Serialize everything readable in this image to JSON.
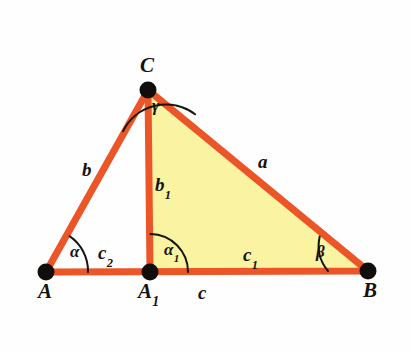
{
  "figure": {
    "type": "geometry-diagram",
    "background_color": "#fefefe",
    "stroke_color": "#eb5528",
    "fill_color": "#faf3a1",
    "arc_color": "#1a1410",
    "point_color": "#100d0b",
    "label_color": "#15110e"
  },
  "vertices": [
    {
      "id": "A",
      "label": "A",
      "sub": "",
      "x": 46,
      "y": 272,
      "label_x": 38,
      "label_y": 281
    },
    {
      "id": "B",
      "label": "B",
      "sub": "",
      "x": 368,
      "y": 271,
      "label_x": 363,
      "label_y": 280
    },
    {
      "id": "C",
      "label": "C",
      "sub": "",
      "x": 148,
      "y": 90,
      "label_x": 140,
      "label_y": 55
    },
    {
      "id": "A1",
      "label": "A",
      "sub": "1",
      "x": 150,
      "y": 272,
      "label_x": 138,
      "label_y": 281
    }
  ],
  "sides": [
    {
      "id": "b",
      "label": "b",
      "sub": "",
      "label_x": 82,
      "label_y": 160,
      "from": "A",
      "to": "C"
    },
    {
      "id": "a",
      "label": "a",
      "sub": "",
      "label_x": 258,
      "label_y": 152,
      "from": "C",
      "to": "B"
    },
    {
      "id": "c",
      "label": "c",
      "sub": "",
      "label_x": 198,
      "label_y": 283,
      "from": "A",
      "to": "B"
    },
    {
      "id": "b1",
      "label": "b",
      "sub": "1",
      "label_x": 155,
      "label_y": 175,
      "from": "C",
      "to": "A1"
    },
    {
      "id": "c1",
      "label": "c",
      "sub": "1",
      "label_x": 243,
      "label_y": 245,
      "from": "A1",
      "to": "B"
    },
    {
      "id": "c2",
      "label": "c",
      "sub": "2",
      "label_x": 98,
      "label_y": 243,
      "from": "A",
      "to": "A1"
    }
  ],
  "angles": [
    {
      "id": "alpha",
      "label": "α",
      "sub": "",
      "at": "A",
      "label_x": 70,
      "label_y": 243,
      "radius": 42
    },
    {
      "id": "beta",
      "label": "β",
      "sub": "",
      "at": "B",
      "label_x": 316,
      "label_y": 243,
      "radius": 40
    },
    {
      "id": "gamma",
      "label": "γ",
      "sub": "",
      "at": "C",
      "label_x": 152,
      "label_y": 97,
      "radius": 48
    },
    {
      "id": "alpha1",
      "label": "α",
      "sub": "1",
      "at": "A1",
      "label_x": 164,
      "label_y": 241,
      "radius": 38
    }
  ],
  "geometry": {
    "outer_triangle_path": "M 46 272 L 148 90 L 368 271 Z",
    "filled_region_path": "M 150 272 L 148 90 L 368 271 Z",
    "altitude_path": "M 148 90 L 150 272",
    "arc_alpha_path": "M 88 272 A 42 42 0 0 0 69.5 236.2",
    "arc_beta_path": "M 328 271 A 40 40 0 0 1 319.7 236.5",
    "arc_gamma_path": "M 123.1 131.1 A 48 48 0 0 1 195.1 114.3",
    "arc_alpha1_path": "M 188 272 A 38 38 0 0 0 150.5 234",
    "stroke_width": 7,
    "arc_stroke_width": 2,
    "point_radius": 8
  }
}
